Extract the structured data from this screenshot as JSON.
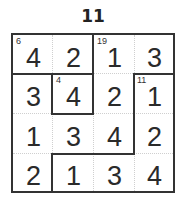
{
  "puzzle": {
    "title": "11",
    "size": 4,
    "grid": [
      [
        "4",
        "2",
        "1",
        "3"
      ],
      [
        "3",
        "4",
        "2",
        "1"
      ],
      [
        "1",
        "3",
        "4",
        "2"
      ],
      [
        "2",
        "1",
        "3",
        "4"
      ]
    ],
    "cages": [
      {
        "sum": "6",
        "cells": [
          [
            0,
            0
          ],
          [
            0,
            1
          ]
        ]
      },
      {
        "sum": "19",
        "cells": [
          [
            0,
            2
          ],
          [
            0,
            3
          ],
          [
            1,
            2
          ],
          [
            2,
            2
          ],
          [
            2,
            1
          ],
          [
            2,
            0
          ],
          [
            1,
            0
          ],
          [
            3,
            0
          ]
        ]
      },
      {
        "sum": "4",
        "cells": [
          [
            1,
            1
          ]
        ]
      },
      {
        "sum": "11",
        "cells": [
          [
            1,
            3
          ],
          [
            2,
            3
          ],
          [
            3,
            3
          ],
          [
            3,
            2
          ],
          [
            3,
            1
          ]
        ]
      }
    ],
    "clues": {
      "r0c0": "6",
      "r0c2": "19",
      "r1c1": "4",
      "r1c3": "11"
    },
    "colors": {
      "line": "#333333",
      "inner_line": "#cfcfcf",
      "digit": "#2a2a2a"
    }
  }
}
